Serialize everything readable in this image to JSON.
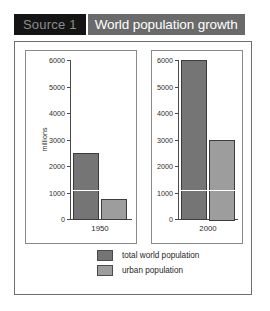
{
  "header": {
    "source_label": "Source 1",
    "title": "World population growth"
  },
  "legend": {
    "items": [
      {
        "label": "total world population",
        "color": "#757575",
        "key": "total"
      },
      {
        "label": "urban population",
        "color": "#9d9d9d",
        "key": "urban"
      }
    ]
  },
  "chart_data": {
    "type": "bar",
    "title": "World population growth",
    "xlabel": "",
    "ylabel": "millions",
    "ylim": [
      0,
      6000
    ],
    "yticks": [
      0,
      1000,
      2000,
      3000,
      4000,
      5000,
      6000
    ],
    "ytick_labels": [
      "0",
      "1000",
      "2000",
      "3000",
      "4000",
      "5000",
      "6000"
    ],
    "categories": [
      "1950",
      "2000"
    ],
    "grid": false,
    "legend_position": "bottom",
    "series": [
      {
        "name": "total world population",
        "values": [
          2500,
          6000
        ],
        "color": "#757575"
      },
      {
        "name": "urban population",
        "values": [
          750,
          3000
        ],
        "color": "#9d9d9d"
      }
    ],
    "annotations": [
      {
        "type": "horizontal-rule",
        "value": 1100,
        "color": "#ffffff"
      }
    ],
    "panels": [
      {
        "category": "1950",
        "tick_label": "1950",
        "bars": [
          {
            "series": "total world population",
            "value": 2500
          },
          {
            "series": "urban population",
            "value": 750
          }
        ]
      },
      {
        "category": "2000",
        "tick_label": "2000",
        "bars": [
          {
            "series": "total world population",
            "value": 6000
          },
          {
            "series": "urban population",
            "value": 3000
          }
        ]
      }
    ]
  }
}
